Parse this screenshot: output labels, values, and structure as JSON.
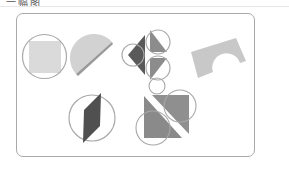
{
  "header": {
    "title": "一幅图"
  },
  "card": {
    "description": "Geometric shapes cut from or inscribed in circles",
    "figures": [
      {
        "name": "square-in-circle",
        "shape": "square",
        "fill": "#d9d9d9"
      },
      {
        "name": "half-disc",
        "shape": "semicircle",
        "fill": "#cfcfcf"
      },
      {
        "name": "triangles-in-circles",
        "shape": "four triangles",
        "fill": "#707070"
      },
      {
        "name": "arch-block",
        "shape": "rectangle with arch cutout",
        "fill": "#c6c6c6"
      },
      {
        "name": "parallelogram-in-circle",
        "shape": "parallelogram",
        "fill": "#555555"
      },
      {
        "name": "split-square-with-circles",
        "shape": "two triangles",
        "fill": "#8a8a8a"
      }
    ]
  },
  "colors": {
    "circle_stroke": "#a0a0a0",
    "card_border": "#a9a9a9",
    "dark_fill": "#555555",
    "mid_fill": "#8a8a8a",
    "light_fill": "#d9d9d9"
  }
}
